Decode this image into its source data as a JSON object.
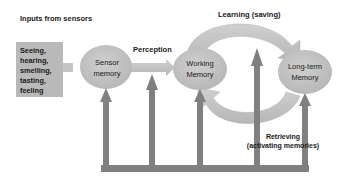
{
  "diagram": {
    "type": "memory-process-flow",
    "inputs_title": "Inputs from sensors",
    "senses_box": {
      "text": "Seeing,\nhearing,\nsmelling,\ntasting,\nfeeling",
      "items": [
        "Seeing",
        "hearing",
        "smelling",
        "tasting",
        "feeling"
      ]
    },
    "nodes": [
      {
        "id": "sensor",
        "label": "Sensor\nmemory"
      },
      {
        "id": "working",
        "label": "Working\nMemory"
      },
      {
        "id": "longterm",
        "label": "Long-term\nMemory"
      }
    ],
    "edges": [
      {
        "from": "senses_box",
        "to": "sensor",
        "label": ""
      },
      {
        "from": "sensor",
        "to": "working",
        "label": "Perception"
      },
      {
        "from": "working",
        "to": "longterm",
        "label": "Learning (saving)"
      },
      {
        "from": "longterm",
        "to": "working",
        "label": "Retrieving\n(activating memories)"
      }
    ],
    "labels": {
      "perception": "Perception",
      "learning": "Learning (saving)",
      "retrieving": "Retrieving\n(activating memories)"
    },
    "feedback_arrows": {
      "count": 5,
      "description": "Vertical arrows rising from a shared bottom bar into each stage"
    },
    "colors": {
      "box_fill": "#b9b9b9",
      "ellipse_fill": "#bdbdbd",
      "arrow_light": "#c4c4c4",
      "arrow_dark": "#7a7a7a",
      "text": "#1a1a1a"
    }
  }
}
